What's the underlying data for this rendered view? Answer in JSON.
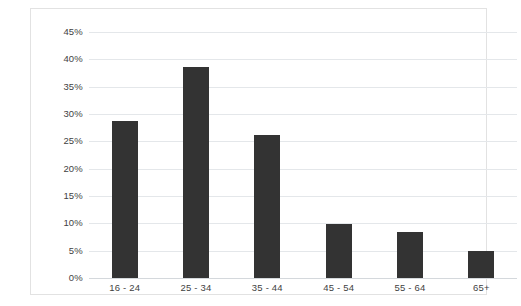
{
  "chart_data": {
    "type": "bar",
    "title": "",
    "subtitle": "",
    "xlabel": "",
    "ylabel": "",
    "categories": [
      "16 - 24",
      "25 - 34",
      "35 - 44",
      "45 - 54",
      "55 - 64",
      "65+"
    ],
    "values": [
      28.7,
      38.6,
      26.1,
      9.9,
      8.4,
      4.9
    ],
    "value_labels": [
      "28.7%",
      "38.6%",
      "26.1%",
      "9.9%",
      "8.4%",
      "4.9%"
    ],
    "series": [
      {
        "name": "",
        "values": [
          28.7,
          38.6,
          26.1,
          9.9,
          8.4,
          4.9
        ]
      }
    ],
    "ylim": [
      0,
      45
    ],
    "ytick_values": [
      0,
      5,
      10,
      15,
      20,
      25,
      30,
      35,
      40,
      45
    ],
    "ytick_labels": [
      "0%",
      "5%",
      "10%",
      "15%",
      "20%",
      "25%",
      "30%",
      "35%",
      "40%",
      "45%"
    ],
    "grid": true,
    "grid_axis": "y",
    "legend": false,
    "legend_position": "none",
    "annotations": [],
    "colors": {
      "bar": "#333333",
      "gridline": "#e4e7ea",
      "baseline": "#d4d8dc",
      "frame_border": "#e2e2e2",
      "tick_label": "#3f3f3f",
      "background": "#ffffff"
    }
  }
}
